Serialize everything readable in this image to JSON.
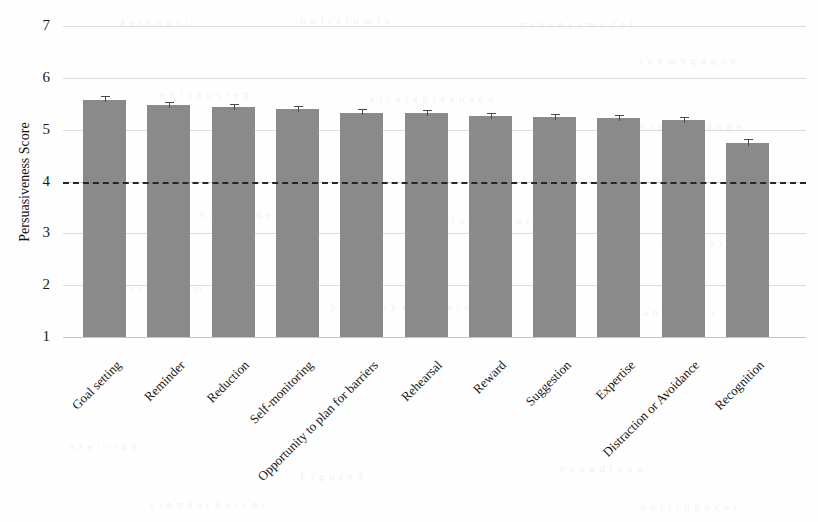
{
  "chart_data": {
    "type": "bar",
    "title": "",
    "subtitle": "",
    "xlabel": "",
    "ylabel": "Persuasiveness Score",
    "ylim": [
      1,
      7
    ],
    "yticks": [
      1,
      2,
      3,
      4,
      5,
      6,
      7
    ],
    "ytick_labels": [
      "1",
      "2",
      "3",
      "4",
      "5",
      "6",
      "7"
    ],
    "grid": true,
    "legend": false,
    "legend_position": "none",
    "bar_color": "#8a8a8a",
    "errorbar_color": "#4a4a4a",
    "threshold_line": {
      "value": 4,
      "style": "dashed",
      "color": "#262626",
      "label": ""
    },
    "categories": [
      "Goal setting",
      "Reminder",
      "Reduction",
      "Self-monitoring",
      "Opportunity to plan for barriers",
      "Rehearsal",
      "Reward",
      "Suggestion",
      "Expertise",
      "Distraction or Avoidance",
      "Recognition"
    ],
    "values": [
      5.58,
      5.48,
      5.43,
      5.39,
      5.33,
      5.32,
      5.27,
      5.25,
      5.23,
      5.19,
      4.75
    ],
    "errors": [
      0.06,
      0.06,
      0.06,
      0.06,
      0.06,
      0.06,
      0.06,
      0.06,
      0.06,
      0.06,
      0.07
    ]
  },
  "ghost_text": [
    {
      "text": "a e t s n  o r i",
      "x": 120,
      "y": 16,
      "size": 11
    },
    {
      "text": "n o i t a l u m i s",
      "x": 300,
      "y": 14,
      "size": 11
    },
    {
      "text": "p r o c e s s  m o d e l",
      "x": 520,
      "y": 18,
      "size": 11
    },
    {
      "text": "t n e m e g a g n e",
      "x": 640,
      "y": 54,
      "size": 11
    },
    {
      "text": "e v i s a u s r e p",
      "x": 160,
      "y": 88,
      "size": 11
    },
    {
      "text": "s t r a t e g i e s  u s e d",
      "x": 370,
      "y": 92,
      "size": 11
    },
    {
      "text": "b e h a v i o u r  c h a n g e",
      "x": 600,
      "y": 120,
      "size": 11
    },
    {
      "text": "n o i t c u d e r",
      "x": 200,
      "y": 208,
      "size": 11
    },
    {
      "text": "r e m i n d e r  s c o r e",
      "x": 420,
      "y": 214,
      "size": 11
    },
    {
      "text": "a p p  d e s i g n",
      "x": 660,
      "y": 236,
      "size": 11
    },
    {
      "text": "g n i r o t i n o m",
      "x": 110,
      "y": 282,
      "size": 11
    },
    {
      "text": "p a r t i c i p a n t s  r a t e d",
      "x": 330,
      "y": 300,
      "size": 11
    },
    {
      "text": "m e a n  v a l u e s",
      "x": 620,
      "y": 306,
      "size": 11
    },
    {
      "text": "s r e i r r a b",
      "x": 70,
      "y": 440,
      "size": 11
    },
    {
      "text": "F i g u r e  3 .",
      "x": 300,
      "y": 470,
      "size": 11
    },
    {
      "text": "e c n a d i o v a",
      "x": 560,
      "y": 462,
      "size": 11
    },
    {
      "text": "s t a n d a r d  e r r o r",
      "x": 150,
      "y": 498,
      "size": 11
    },
    {
      "text": "n o i t i n g o c e r",
      "x": 640,
      "y": 500,
      "size": 11
    }
  ]
}
